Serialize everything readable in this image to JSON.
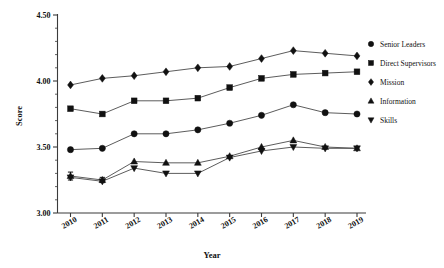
{
  "chart_data": {
    "type": "line",
    "title": "",
    "xlabel": "Year",
    "ylabel": "Score",
    "x": [
      2010,
      2011,
      2012,
      2013,
      2014,
      2015,
      2016,
      2017,
      2018,
      2019
    ],
    "categories": [
      "2010",
      "2011",
      "2012",
      "2013",
      "2014",
      "2015",
      "2016",
      "2017",
      "2018",
      "2019"
    ],
    "ylim": [
      3.0,
      4.5
    ],
    "ytick_labels": [
      "3.00",
      "3.50",
      "4.00",
      "4.50"
    ],
    "ytick_values": [
      3.0,
      3.5,
      4.0,
      4.5
    ],
    "yminor_step": 0.1,
    "grid": false,
    "legend_position": "right",
    "series": [
      {
        "name": "Senior Leaders",
        "marker": "circle",
        "color": "#111111",
        "values": [
          3.48,
          3.49,
          3.6,
          3.6,
          3.63,
          3.68,
          3.74,
          3.82,
          3.76,
          3.75
        ]
      },
      {
        "name": "Direct Supervisors",
        "marker": "square",
        "color": "#111111",
        "values": [
          3.79,
          3.75,
          3.85,
          3.85,
          3.87,
          3.95,
          4.02,
          4.05,
          4.06,
          4.07
        ]
      },
      {
        "name": "Mission",
        "marker": "diamond",
        "color": "#111111",
        "values": [
          3.97,
          4.02,
          4.04,
          4.07,
          4.1,
          4.11,
          4.17,
          4.23,
          4.21,
          4.19
        ]
      },
      {
        "name": "Information",
        "marker": "triangle-up",
        "color": "#111111",
        "values": [
          3.28,
          3.25,
          3.39,
          3.38,
          3.38,
          3.43,
          3.5,
          3.55,
          3.5,
          3.49
        ]
      },
      {
        "name": "Skills",
        "marker": "triangle-down",
        "color": "#111111",
        "values": [
          3.27,
          3.24,
          3.34,
          3.3,
          3.3,
          3.42,
          3.47,
          3.5,
          3.49,
          3.49
        ]
      }
    ],
    "error_bars": [
      {
        "series": "Information",
        "x": 2010,
        "value": 3.28,
        "low": 3.25,
        "high": 3.31
      },
      {
        "series": "Information",
        "x": 2011,
        "value": 3.25,
        "low": 3.23,
        "high": 3.27
      }
    ]
  },
  "legend": {
    "items": [
      {
        "label": "Senior Leaders",
        "marker": "circle"
      },
      {
        "label": "Direct Supervisors",
        "marker": "square"
      },
      {
        "label": "Mission",
        "marker": "diamond"
      },
      {
        "label": "Information",
        "marker": "triangle-up"
      },
      {
        "label": "Skills",
        "marker": "triangle-down"
      }
    ]
  },
  "axes": {
    "y_title": "Score",
    "x_title": "Year"
  }
}
